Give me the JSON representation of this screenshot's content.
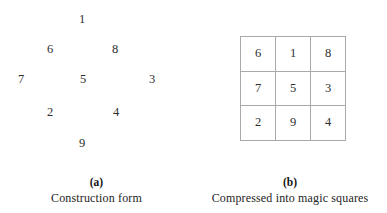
{
  "figure": {
    "background_color": "#ffffff",
    "text_color": "#2e2e2e",
    "grid_line_color": "#a9a9a9"
  },
  "panel_a": {
    "caption_tag": "(a)",
    "caption_text": "Construction form",
    "layout": "diamond",
    "nodes": [
      {
        "value": "1",
        "x": 74,
        "y": 11
      },
      {
        "value": "6",
        "x": 42,
        "y": 41
      },
      {
        "value": "8",
        "x": 107,
        "y": 41
      },
      {
        "value": "7",
        "x": 13,
        "y": 71
      },
      {
        "value": "5",
        "x": 75,
        "y": 71
      },
      {
        "value": "3",
        "x": 144,
        "y": 71
      },
      {
        "value": "2",
        "x": 42,
        "y": 104
      },
      {
        "value": "4",
        "x": 108,
        "y": 104
      },
      {
        "value": "9",
        "x": 74,
        "y": 135
      }
    ]
  },
  "panel_b": {
    "caption_tag": "(b)",
    "caption_text": "Compressed into magic squares",
    "layout": "grid-3x3",
    "rows": [
      [
        "6",
        "1",
        "8"
      ],
      [
        "7",
        "5",
        "3"
      ],
      [
        "2",
        "9",
        "4"
      ]
    ]
  }
}
